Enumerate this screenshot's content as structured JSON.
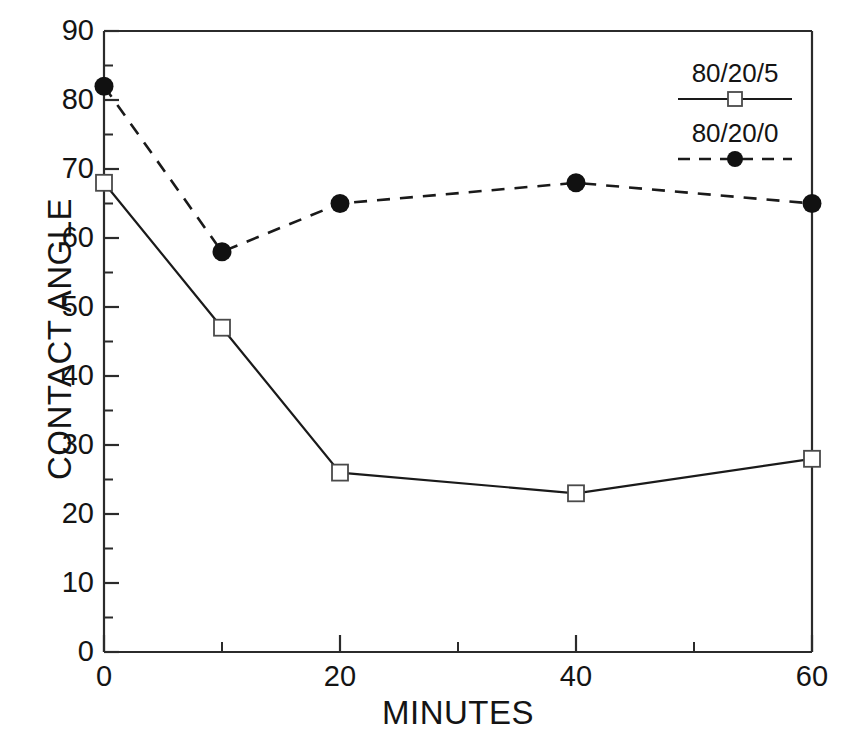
{
  "chart_data": {
    "type": "line",
    "title": "",
    "xlabel": "MINUTES",
    "ylabel": "CONTACT ANGLE",
    "xlim": [
      0,
      60
    ],
    "ylim": [
      0,
      90
    ],
    "xticks": [
      0,
      20,
      40,
      60
    ],
    "xtick_labels": [
      "0",
      "20",
      "40",
      "60"
    ],
    "xminor_ticks": [
      10,
      30,
      50
    ],
    "yticks": [
      0,
      10,
      20,
      30,
      40,
      50,
      60,
      70,
      80,
      90
    ],
    "ytick_labels": [
      "0",
      "10",
      "20",
      "30",
      "40",
      "50",
      "60",
      "70",
      "80",
      "90"
    ],
    "yminor_ticks": [
      5,
      15,
      25,
      35,
      45,
      55,
      65,
      75,
      85
    ],
    "grid": false,
    "legend_position": "top-right-inside",
    "x": [
      0,
      10,
      20,
      40,
      60
    ],
    "series": [
      {
        "name": "80/20/5",
        "values": [
          68,
          47,
          26,
          23,
          28
        ],
        "linestyle": "solid",
        "marker": "open-square",
        "color": "#1a1a1a"
      },
      {
        "name": "80/20/0",
        "values": [
          82,
          58,
          65,
          68,
          65
        ],
        "linestyle": "dashed",
        "marker": "filled-circle",
        "color": "#1a1a1a"
      }
    ]
  },
  "legend": {
    "entries": [
      {
        "label": "80/20/5"
      },
      {
        "label": "80/20/0"
      }
    ]
  },
  "axes": {
    "y_title": "CONTACT ANGLE",
    "x_title": "MINUTES",
    "ytick_labels": [
      "90",
      "80",
      "70",
      "60",
      "50",
      "40",
      "30",
      "20",
      "10",
      "0"
    ],
    "xtick_labels": [
      "0",
      "20",
      "40",
      "60"
    ]
  },
  "colors": {
    "ink": "#1a1a1a",
    "background": "#ffffff"
  }
}
